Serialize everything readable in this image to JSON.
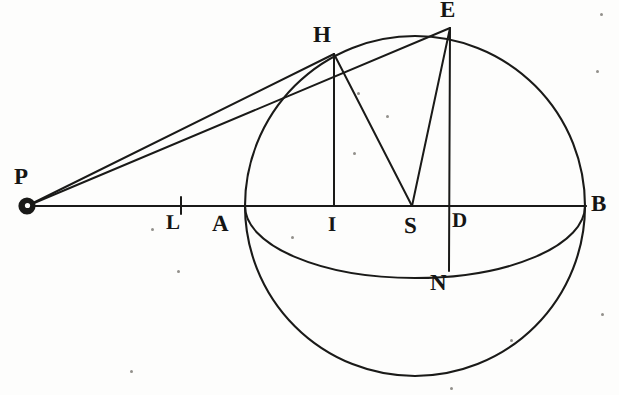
{
  "figure": {
    "ink_color": "#1a1a18",
    "background_color": "#fdfdfc",
    "stroke_width": 2.0
  },
  "geometry": {
    "circle": {
      "cx": 415,
      "cy": 206,
      "r": 170
    },
    "ellipse": {
      "cx": 415,
      "cy": 206,
      "rx": 170,
      "ry": 72
    },
    "axis_line": {
      "x1": 27,
      "y1": 206,
      "x2": 586,
      "y2": 206
    },
    "points": {
      "P": {
        "x": 27,
        "y": 206
      },
      "L": {
        "x": 181,
        "y": 206
      },
      "A": {
        "x": 245,
        "y": 206
      },
      "I": {
        "x": 334,
        "y": 206
      },
      "S": {
        "x": 412,
        "y": 206
      },
      "D": {
        "x": 449,
        "y": 206
      },
      "B": {
        "x": 586,
        "y": 206
      },
      "H": {
        "x": 334,
        "y": 54
      },
      "E": {
        "x": 450,
        "y": 28
      },
      "N": {
        "x": 449,
        "y": 271
      }
    },
    "segments": [
      {
        "name": "P-to-H",
        "from": "P",
        "to": "H"
      },
      {
        "name": "P-to-E",
        "from": "P",
        "to": "E"
      },
      {
        "name": "P-to-B",
        "from": "P",
        "to": "B"
      },
      {
        "name": "H-ordinate",
        "from": "H",
        "to": "I"
      },
      {
        "name": "E-ordinate",
        "from": "E",
        "to": "N"
      },
      {
        "name": "H-to-S",
        "from": "H",
        "to": "S"
      },
      {
        "name": "E-to-S",
        "from": "E",
        "to": "S"
      }
    ]
  },
  "labels": [
    {
      "id": "label-P",
      "text": "P",
      "x": 14,
      "y": 165,
      "size": "sz-big"
    },
    {
      "id": "label-L",
      "text": "L",
      "x": 166,
      "y": 212,
      "size": "sz-med"
    },
    {
      "id": "label-A",
      "text": "A",
      "x": 212,
      "y": 212,
      "size": "sz-big"
    },
    {
      "id": "label-I",
      "text": "I",
      "x": 328,
      "y": 214,
      "size": "sz-med"
    },
    {
      "id": "label-S",
      "text": "S",
      "x": 404,
      "y": 214,
      "size": "sz-big"
    },
    {
      "id": "label-D",
      "text": "D",
      "x": 452,
      "y": 210,
      "size": "sz-med"
    },
    {
      "id": "label-B",
      "text": "B",
      "x": 591,
      "y": 192,
      "size": "sz-big"
    },
    {
      "id": "label-H",
      "text": "H",
      "x": 313,
      "y": 23,
      "size": "sz-big"
    },
    {
      "id": "label-E",
      "text": "E",
      "x": 440,
      "y": -2,
      "size": "sz-big"
    },
    {
      "id": "label-N",
      "text": "N",
      "x": 430,
      "y": 271,
      "size": "sz-big"
    }
  ],
  "specks": [
    {
      "x": 151,
      "y": 228,
      "d": 3
    },
    {
      "x": 177,
      "y": 270,
      "d": 3
    },
    {
      "x": 291,
      "y": 236,
      "d": 3
    },
    {
      "x": 357,
      "y": 92,
      "d": 3
    },
    {
      "x": 386,
      "y": 115,
      "d": 3
    },
    {
      "x": 353,
      "y": 152,
      "d": 3
    },
    {
      "x": 600,
      "y": 13,
      "d": 3
    },
    {
      "x": 596,
      "y": 70,
      "d": 3
    },
    {
      "x": 601,
      "y": 313,
      "d": 3
    },
    {
      "x": 510,
      "y": 339,
      "d": 3
    },
    {
      "x": 130,
      "y": 370,
      "d": 3
    },
    {
      "x": 450,
      "y": 387,
      "d": 3
    }
  ]
}
